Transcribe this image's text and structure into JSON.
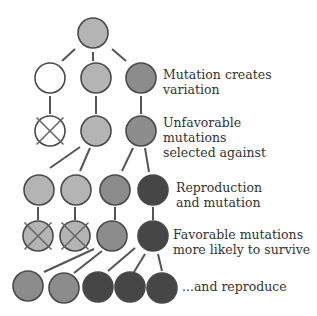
{
  "colors": {
    "white": "#ffffff",
    "light": "#b4b4b4",
    "mid": "#8c8c8c",
    "dark": "#464646",
    "stroke": "#4a4a4a",
    "line": "#555555",
    "text": "#333333"
  },
  "labels": [
    {
      "id": "mutation",
      "lines": [
        "Mutation creates",
        "variation"
      ],
      "x": 163,
      "y": 67
    },
    {
      "id": "unfavorable",
      "lines": [
        "Unfavorable",
        "mutations",
        "selected against"
      ],
      "x": 163,
      "y": 115
    },
    {
      "id": "reproduction",
      "lines": [
        "Reproduction",
        "and mutation"
      ],
      "x": 176,
      "y": 180
    },
    {
      "id": "favorable",
      "lines": [
        "Favorable mutations",
        "more likely to survive"
      ],
      "x": 173,
      "y": 227
    },
    {
      "id": "reproduce",
      "lines": [
        "...and reproduce"
      ],
      "x": 182,
      "y": 279
    }
  ],
  "nodes": [
    {
      "x": 93,
      "y": 33,
      "r": 15,
      "fill": "light",
      "crossed": false
    },
    {
      "x": 50,
      "y": 78,
      "r": 15,
      "fill": "white",
      "crossed": false
    },
    {
      "x": 96,
      "y": 78,
      "r": 15,
      "fill": "light",
      "crossed": false
    },
    {
      "x": 141,
      "y": 78,
      "r": 15,
      "fill": "mid",
      "crossed": false
    },
    {
      "x": 50,
      "y": 131,
      "r": 15,
      "fill": "white",
      "crossed": true
    },
    {
      "x": 96,
      "y": 131,
      "r": 15,
      "fill": "light",
      "crossed": false
    },
    {
      "x": 141,
      "y": 131,
      "r": 15,
      "fill": "mid",
      "crossed": false
    },
    {
      "x": 39,
      "y": 190,
      "r": 15,
      "fill": "light",
      "crossed": false
    },
    {
      "x": 76,
      "y": 190,
      "r": 15,
      "fill": "light",
      "crossed": false
    },
    {
      "x": 115,
      "y": 190,
      "r": 15,
      "fill": "mid",
      "crossed": false
    },
    {
      "x": 153,
      "y": 190,
      "r": 15,
      "fill": "dark",
      "crossed": false
    },
    {
      "x": 38,
      "y": 236,
      "r": 15,
      "fill": "light",
      "crossed": true
    },
    {
      "x": 75,
      "y": 236,
      "r": 15,
      "fill": "light",
      "crossed": true
    },
    {
      "x": 112,
      "y": 236,
      "r": 15,
      "fill": "mid",
      "crossed": false
    },
    {
      "x": 153,
      "y": 236,
      "r": 15,
      "fill": "dark",
      "crossed": false
    },
    {
      "x": 28,
      "y": 286,
      "r": 15,
      "fill": "mid",
      "crossed": false
    },
    {
      "x": 64,
      "y": 288,
      "r": 15,
      "fill": "mid",
      "crossed": false
    },
    {
      "x": 98,
      "y": 287,
      "r": 15,
      "fill": "dark",
      "crossed": false
    },
    {
      "x": 130,
      "y": 287,
      "r": 15,
      "fill": "dark",
      "crossed": false
    },
    {
      "x": 162,
      "y": 288,
      "r": 15,
      "fill": "dark",
      "crossed": false
    }
  ],
  "edges": [
    [
      75,
      49,
      62,
      61
    ],
    [
      93,
      52,
      93,
      61
    ],
    [
      112,
      49,
      126,
      61
    ],
    [
      50,
      96,
      50,
      114
    ],
    [
      96,
      96,
      96,
      114
    ],
    [
      141,
      96,
      141,
      114
    ],
    [
      80,
      147,
      50,
      168
    ],
    [
      90,
      148,
      80,
      171
    ],
    [
      133,
      148,
      122,
      171
    ],
    [
      145,
      148,
      149,
      172
    ],
    [
      38,
      207,
      38,
      220
    ],
    [
      75,
      207,
      75,
      220
    ],
    [
      115,
      207,
      115,
      220
    ],
    [
      153,
      207,
      153,
      220
    ],
    [
      94,
      249,
      44,
      272
    ],
    [
      102,
      251,
      74,
      273
    ],
    [
      135,
      248,
      108,
      271
    ],
    [
      145,
      254,
      134,
      272
    ],
    [
      158,
      254,
      162,
      271
    ]
  ]
}
